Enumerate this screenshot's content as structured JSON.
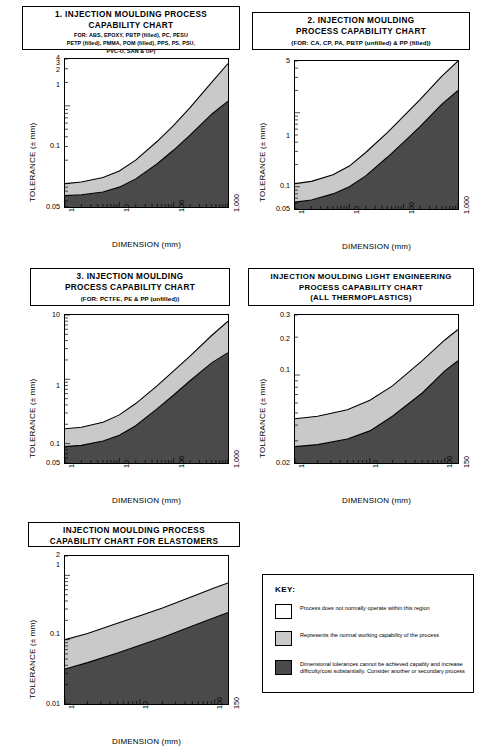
{
  "document": {
    "kind": "injection-moulding-process-capability-charts"
  },
  "charts": [
    {
      "id": "chart1",
      "title_line1": "1. INJECTION MOULDING PROCESS",
      "title_line2": "CAPABILITY CHART",
      "sub_line1": "FOR: ABS, EPOXY, PBTP (filled), PC, PESU",
      "sub_line2": "PETP (filled), PMMA, POM (filled), PPS, PS, PSU,",
      "sub_line3": "PVC-U, SAN & UP)",
      "xlabel": "DIMENSION (mm)",
      "ylabel": "TOLERANCE (± mm)",
      "xticks": [
        "1",
        "10",
        "100",
        "1,000"
      ],
      "yticks": [
        "0.05",
        "0.1",
        "1",
        "2",
        "3",
        "4"
      ]
    },
    {
      "id": "chart2",
      "title_line1": "2.  INJECTION  MOULDING",
      "title_line2": "PROCESS CAPABILITY CHART",
      "sub_line1": "(FOR: CA,  CP, PA, PBTP (unfilled)  &  PP (filled))",
      "xlabel": "DIMENSION (mm)",
      "ylabel": "TOLERANCE (± mm)",
      "xticks": [
        "1",
        "10",
        "100",
        "1,000"
      ],
      "yticks": [
        "0.05",
        "0.1",
        "1",
        "5"
      ]
    },
    {
      "id": "chart3",
      "title_line1": "3.  INJECTION  MOULDING",
      "title_line2": "PROCESS CAPABILITY CHART",
      "sub_line1": "(FOR: PCTFE, PE & PP (unfilled))",
      "xlabel": "DIMENSION (mm)",
      "ylabel": "TOLERANCE (± mm)",
      "xticks": [
        "1",
        "10",
        "100",
        "1,000"
      ],
      "yticks": [
        "0.05",
        "0.1",
        "1",
        "10"
      ]
    },
    {
      "id": "chart4",
      "title_line1": "INJECTION MOULDING LIGHT ENGINEERING",
      "title_line2": "PROCESS CAPABILITY CHART",
      "title_line3": "(ALL THERMOPLASTICS)",
      "xlabel": "DIMENSION (mm)",
      "ylabel": "TOLERANCE (± mm)",
      "xticks": [
        "1",
        "10",
        "100",
        "150"
      ],
      "yticks": [
        "0.02",
        "0.1",
        "0.2",
        "0.3"
      ]
    },
    {
      "id": "chart5",
      "title_line1": "INJECTION MOULDING PROCESS",
      "title_line2": "CAPABILITY CHART FOR ELASTOMERS",
      "xlabel": "DIMENSION (mm)",
      "ylabel": "TOLERANCE (± mm)",
      "xticks": [
        "1",
        "10",
        "100",
        "150"
      ],
      "yticks": [
        "0.01",
        "0.1",
        "1",
        "2"
      ]
    }
  ],
  "key": {
    "heading": "KEY:",
    "items": [
      {
        "color": "#ffffff",
        "text": "Process does not normally operate within this region"
      },
      {
        "color": "#c9c9c9",
        "text": "Represents the normal working capability of the process"
      },
      {
        "color": "#4a4a4a",
        "text": "Dimensional tolerances cannot be achieved capably and increase difficulty/cost substantially. Consider another or secondary process"
      }
    ]
  },
  "colors": {
    "white_region": "#ffffff",
    "normal_region": "#c9c9c9",
    "difficult_region": "#4a4a4a",
    "outline": "#000000"
  },
  "chart_data": [
    {
      "type": "area",
      "id": "chart1",
      "title": "1. INJECTION MOULDING PROCESS CAPABILITY CHART",
      "xlabel": "DIMENSION (mm)",
      "ylabel": "TOLERANCE (± mm)",
      "xscale": "log",
      "yscale": "log",
      "xlim": [
        1,
        1000
      ],
      "ylim": [
        0.05,
        4
      ],
      "x": [
        1,
        2,
        5,
        10,
        20,
        50,
        100,
        200,
        500,
        1000
      ],
      "series": [
        {
          "name": "upper boundary (normal capability limit)",
          "values": [
            0.1,
            0.105,
            0.12,
            0.145,
            0.2,
            0.35,
            0.56,
            0.95,
            2.0,
            3.5
          ]
        },
        {
          "name": "lower boundary (difficult region limit)",
          "values": [
            0.07,
            0.072,
            0.078,
            0.09,
            0.115,
            0.18,
            0.27,
            0.42,
            0.78,
            1.15
          ]
        }
      ]
    },
    {
      "type": "area",
      "id": "chart2",
      "title": "2. INJECTION MOULDING PROCESS CAPABILITY CHART",
      "xlabel": "DIMENSION (mm)",
      "ylabel": "TOLERANCE (± mm)",
      "xscale": "log",
      "yscale": "log",
      "xlim": [
        1,
        1000
      ],
      "ylim": [
        0.05,
        5
      ],
      "x": [
        1,
        2,
        5,
        10,
        20,
        50,
        100,
        200,
        500,
        1000
      ],
      "series": [
        {
          "name": "upper boundary (normal capability limit)",
          "values": [
            0.11,
            0.118,
            0.145,
            0.19,
            0.29,
            0.54,
            0.9,
            1.5,
            3.1,
            5.0
          ]
        },
        {
          "name": "lower boundary (difficult region limit)",
          "values": [
            0.062,
            0.066,
            0.08,
            0.1,
            0.14,
            0.25,
            0.4,
            0.65,
            1.3,
            2.0
          ]
        }
      ]
    },
    {
      "type": "area",
      "id": "chart3",
      "title": "3. INJECTION MOULDING PROCESS CAPABILITY CHART",
      "xlabel": "DIMENSION (mm)",
      "ylabel": "TOLERANCE (± mm)",
      "xscale": "log",
      "yscale": "log",
      "xlim": [
        1,
        1000
      ],
      "ylim": [
        0.05,
        10
      ],
      "x": [
        1,
        2,
        5,
        10,
        20,
        50,
        100,
        200,
        500,
        1000
      ],
      "series": [
        {
          "name": "upper boundary (normal capability limit)",
          "values": [
            0.17,
            0.18,
            0.215,
            0.28,
            0.42,
            0.8,
            1.35,
            2.3,
            4.8,
            8.0
          ]
        },
        {
          "name": "lower boundary (difficult region limit)",
          "values": [
            0.09,
            0.094,
            0.11,
            0.135,
            0.19,
            0.35,
            0.57,
            0.95,
            1.8,
            2.6
          ]
        }
      ]
    },
    {
      "type": "area",
      "id": "chart4",
      "title": "INJECTION MOULDING LIGHT ENGINEERING PROCESS CAPABILITY CHART (ALL THERMOPLASTICS)",
      "xlabel": "DIMENSION (mm)",
      "ylabel": "TOLERANCE (± mm)",
      "xscale": "log",
      "yscale": "log",
      "xlim": [
        1,
        150
      ],
      "ylim": [
        0.02,
        0.3
      ],
      "x": [
        1,
        2,
        5,
        10,
        20,
        50,
        100,
        150
      ],
      "series": [
        {
          "name": "upper boundary (normal capability limit)",
          "values": [
            0.045,
            0.047,
            0.053,
            0.063,
            0.082,
            0.13,
            0.19,
            0.23
          ]
        },
        {
          "name": "lower boundary (difficult region limit)",
          "values": [
            0.027,
            0.028,
            0.031,
            0.036,
            0.047,
            0.072,
            0.108,
            0.13
          ]
        }
      ]
    },
    {
      "type": "area",
      "id": "chart5",
      "title": "INJECTION MOULDING PROCESS CAPABILITY CHART FOR ELASTOMERS",
      "xlabel": "DIMENSION (mm)",
      "ylabel": "TOLERANCE (± mm)",
      "xscale": "log",
      "yscale": "log",
      "xlim": [
        1,
        150
      ],
      "ylim": [
        0.01,
        2
      ],
      "x": [
        1,
        2,
        5,
        10,
        20,
        50,
        100,
        150
      ],
      "series": [
        {
          "name": "upper boundary (normal capability limit)",
          "values": [
            0.1,
            0.125,
            0.18,
            0.235,
            0.31,
            0.47,
            0.64,
            0.76
          ]
        },
        {
          "name": "lower boundary (difficult region limit)",
          "values": [
            0.035,
            0.044,
            0.062,
            0.082,
            0.108,
            0.163,
            0.222,
            0.265
          ]
        }
      ]
    }
  ]
}
